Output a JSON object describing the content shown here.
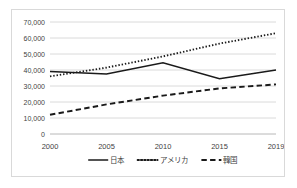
{
  "chart_data": {
    "type": "line",
    "title": "",
    "xlabel": "",
    "ylabel": "",
    "categories": [
      "2000",
      "2005",
      "2010",
      "2015",
      "2019"
    ],
    "x": [
      2000,
      2005,
      2010,
      2015,
      2019
    ],
    "ylim": [
      0,
      70000
    ],
    "ytick_labels": [
      "0",
      "10,000",
      "20,000",
      "30,000",
      "40,000",
      "50,000",
      "60,000",
      "70,000"
    ],
    "ytick_values": [
      0,
      10000,
      20000,
      30000,
      40000,
      50000,
      60000,
      70000
    ],
    "grid": true,
    "legend_position": "bottom",
    "series": [
      {
        "name": "日本",
        "style": "solid",
        "color": "#1a1a1a",
        "values": [
          39000,
          37500,
          44500,
          34500,
          40000
        ]
      },
      {
        "name": "アメリカ",
        "style": "dotted",
        "color": "#1a1a1a",
        "values": [
          36000,
          41500,
          48500,
          56500,
          63000
        ]
      },
      {
        "name": "韓国",
        "style": "dashed",
        "color": "#1a1a1a",
        "values": [
          12000,
          18500,
          24000,
          28500,
          31000
        ]
      }
    ]
  },
  "legend": {
    "items": [
      {
        "label": "日本",
        "style": "solid"
      },
      {
        "label": "アメリカ",
        "style": "dotted"
      },
      {
        "label": "韓国",
        "style": "dashed"
      }
    ]
  },
  "colors": {
    "line": "#1a1a1a",
    "grid": "#d0d0d0",
    "axis": "#b0b0b0",
    "border": "#d9d9d9",
    "text": "#3f3f3f",
    "background": "#ffffff"
  }
}
